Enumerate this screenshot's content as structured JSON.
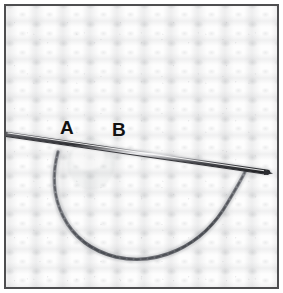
{
  "figure": {
    "kind": "photograph",
    "frame_color": "#4e4e50",
    "background_color": "#ffffff"
  },
  "fabric": {
    "name": "white-knit-fabric",
    "color": "#fdfdfd",
    "shadow_color": "#7a7c82",
    "rib_spacing_px": 27,
    "row_spacing_px": 19
  },
  "needle": {
    "name": "knitting-needle",
    "color": "#3a3b3f",
    "highlight_color": "#e9e9ec",
    "start": {
      "x": 6,
      "y": 133
    },
    "end": {
      "x": 266,
      "y": 170
    }
  },
  "thread_loop": {
    "name": "yarn-loop",
    "color": "#6e7076",
    "start": {
      "x": 56,
      "y": 150
    },
    "bottom": {
      "x": 150,
      "y": 256
    },
    "end": {
      "x": 243,
      "y": 170
    }
  },
  "labels": [
    {
      "id": "a",
      "text": "A",
      "x": 54,
      "y": 112
    },
    {
      "id": "b",
      "text": "B",
      "x": 106,
      "y": 114
    }
  ]
}
